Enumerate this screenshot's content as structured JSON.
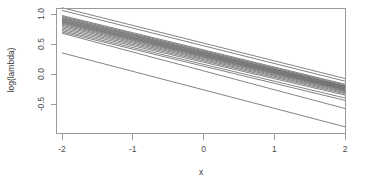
{
  "chart_data": {
    "type": "line",
    "title": "",
    "subtitle": "",
    "xlabel": "x",
    "ylabel": "log(lambda)",
    "xlim": [
      -2,
      2
    ],
    "ylim": [
      -0.95,
      1.18
    ],
    "xticks": [
      -2,
      -1,
      0,
      1,
      2
    ],
    "xticklabels": [
      "-2",
      "-1",
      "0",
      "1",
      "2"
    ],
    "yticks": [
      1.0,
      0.5,
      0.0,
      -0.5
    ],
    "yticklabels": [
      "1.0",
      "0.5",
      "0.0",
      "-0.5"
    ],
    "grid": false,
    "legend": false,
    "legend_position": "none",
    "line_color": "#5a5a5a",
    "frame_color": "#9a9a9a",
    "x": [
      -2,
      2
    ],
    "series": [
      {
        "name": "line-01",
        "values": [
          1.105,
          -0.075
        ]
      },
      {
        "name": "line-02",
        "values": [
          1.06,
          -0.12
        ]
      },
      {
        "name": "line-03",
        "values": [
          0.975,
          -0.17
        ]
      },
      {
        "name": "line-04",
        "values": [
          0.958,
          -0.185
        ]
      },
      {
        "name": "line-05",
        "values": [
          0.942,
          -0.2
        ]
      },
      {
        "name": "line-06",
        "values": [
          0.928,
          -0.208
        ]
      },
      {
        "name": "line-07",
        "values": [
          0.915,
          -0.218
        ]
      },
      {
        "name": "line-08",
        "values": [
          0.9,
          -0.228
        ]
      },
      {
        "name": "line-09",
        "values": [
          0.888,
          -0.238
        ]
      },
      {
        "name": "line-10",
        "values": [
          0.875,
          -0.248
        ]
      },
      {
        "name": "line-11",
        "values": [
          0.862,
          -0.258
        ]
      },
      {
        "name": "line-12",
        "values": [
          0.848,
          -0.268
        ]
      },
      {
        "name": "line-13",
        "values": [
          0.832,
          -0.28
        ]
      },
      {
        "name": "line-14",
        "values": [
          0.812,
          -0.295
        ]
      },
      {
        "name": "line-15",
        "values": [
          0.792,
          -0.312
        ]
      },
      {
        "name": "line-16",
        "values": [
          0.768,
          -0.33
        ]
      },
      {
        "name": "line-17",
        "values": [
          0.745,
          -0.352
        ]
      },
      {
        "name": "line-18",
        "values": [
          0.722,
          -0.4
        ]
      },
      {
        "name": "line-19",
        "values": [
          0.7,
          -0.44
        ]
      },
      {
        "name": "line-20",
        "values": [
          0.68,
          -0.575
        ]
      },
      {
        "name": "line-21",
        "values": [
          0.352,
          -0.88
        ]
      }
    ]
  },
  "figure": {
    "xlabel": "x",
    "ylabel": "log(lambda)"
  }
}
